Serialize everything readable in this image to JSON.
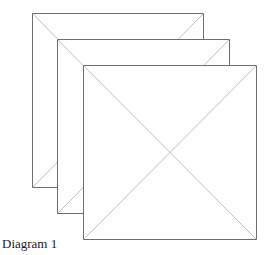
{
  "caption": "Diagram 1",
  "colors": {
    "border": "#6e6e6e",
    "diagonal": "#bdbdbd",
    "fill": "#ffffff"
  },
  "squares": [
    {
      "name": "back",
      "x1": 32,
      "y1": 13,
      "x2": 203,
      "y2": 187
    },
    {
      "name": "middle",
      "x1": 57,
      "y1": 39,
      "x2": 229,
      "y2": 213
    },
    {
      "name": "front",
      "x1": 83,
      "y1": 65,
      "x2": 256,
      "y2": 239
    }
  ]
}
